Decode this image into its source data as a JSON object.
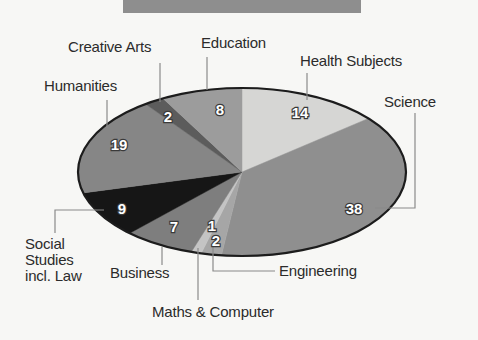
{
  "chart_data": {
    "type": "pie",
    "title": "",
    "start_angle_deg": 90,
    "direction": "clockwise",
    "slices": [
      {
        "label": "Health Subjects",
        "value": 14,
        "color": "#d6d6d4"
      },
      {
        "label": "Science",
        "value": 38,
        "color": "#8f8f8f"
      },
      {
        "label": "Engineering",
        "value": 2,
        "color": "#a6a6a6"
      },
      {
        "label": "Maths & Computer",
        "value": 1,
        "color": "#c4c4c4"
      },
      {
        "label": "Business",
        "value": 7,
        "color": "#7e7e7e"
      },
      {
        "label": "Social Studies incl. Law",
        "value": 9,
        "color": "#161616"
      },
      {
        "label": "Humanities",
        "value": 19,
        "color": "#868686"
      },
      {
        "label": "Creative Arts",
        "value": 2,
        "color": "#5c5c5c"
      },
      {
        "label": "Education",
        "value": 8,
        "color": "#9c9c9c"
      }
    ],
    "total": 100,
    "legend": "callout labels"
  },
  "labels": {
    "creative_arts": "Creative Arts",
    "education": "Education",
    "health": "Health Subjects",
    "humanities": "Humanities",
    "science": "Science",
    "social_1": "Social",
    "social_2": "Studies",
    "social_3": "incl. Law",
    "business": "Business",
    "engineering": "Engineering",
    "maths": "Maths & Computer"
  },
  "values": {
    "health": "14",
    "science": "38",
    "engineering": "2",
    "maths": "1",
    "business": "7",
    "social": "9",
    "humanities": "19",
    "creative_arts": "2",
    "education": "8"
  }
}
